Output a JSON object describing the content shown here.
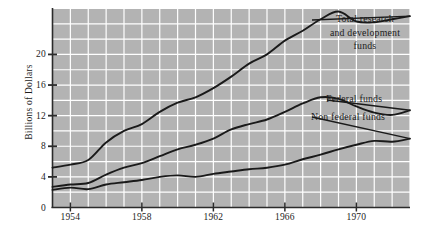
{
  "chart_data": {
    "type": "line",
    "title": "",
    "subtitle": "",
    "xlabel": "",
    "ylabel": "Billions of Dollars",
    "xlim": [
      1953,
      1973
    ],
    "ylim": [
      0,
      26
    ],
    "yticks": [
      0,
      4,
      8,
      12,
      16,
      20
    ],
    "ytick_labels": [
      "0",
      "4",
      "8",
      "12",
      "16",
      "20"
    ],
    "xticks": [
      1954,
      1958,
      1962,
      1966,
      1970
    ],
    "xtick_labels": [
      "1954",
      "1958",
      "1962",
      "1966",
      "1970"
    ],
    "grid": true,
    "grid_x_step": 1,
    "grid_y_step": 2,
    "legend_position": "inline-right-annotations",
    "background_color": "#b3b3b3",
    "grid_color": "#ffffff",
    "line_color": "#1a1a1a",
    "axis_color": "#2b2b2b",
    "x": [
      1953,
      1954,
      1955,
      1956,
      1957,
      1958,
      1959,
      1960,
      1961,
      1962,
      1963,
      1964,
      1965,
      1966,
      1967,
      1968,
      1969,
      1970,
      1971,
      1972,
      1973
    ],
    "series": [
      {
        "name": "Total research and development funds",
        "label": "Total research\nand development\nfunds",
        "values": [
          5.2,
          5.6,
          6.2,
          8.5,
          10.0,
          10.9,
          12.5,
          13.7,
          14.4,
          15.6,
          17.1,
          18.8,
          20.0,
          21.8,
          23.1,
          24.6,
          25.6,
          24.3,
          24.2,
          24.6,
          25.0
        ]
      },
      {
        "name": "Federal funds",
        "label": "Federal funds",
        "values": [
          2.7,
          3.0,
          3.2,
          4.3,
          5.2,
          5.8,
          6.7,
          7.6,
          8.2,
          9.0,
          10.2,
          10.9,
          11.5,
          12.5,
          13.6,
          14.4,
          14.2,
          13.2,
          12.4,
          12.1,
          12.7
        ]
      },
      {
        "name": "Non federal funds",
        "label": "Non federal funds",
        "values": [
          2.3,
          2.6,
          2.4,
          3.0,
          3.3,
          3.6,
          4.0,
          4.2,
          4.0,
          4.4,
          4.7,
          5.0,
          5.2,
          5.6,
          6.3,
          6.9,
          7.6,
          8.2,
          8.7,
          8.6,
          9.0
        ]
      }
    ]
  },
  "axes": {
    "y_axis_title": "Billions of Dollars"
  }
}
